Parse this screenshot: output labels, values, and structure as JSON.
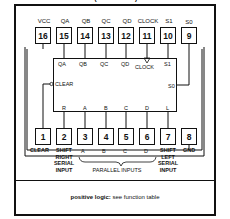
{
  "diagram": {
    "title": "(TOP VIEW)",
    "top_pins": [
      {
        "number": "16",
        "label": "VCC"
      },
      {
        "number": "15",
        "label": "QA"
      },
      {
        "number": "14",
        "label": "QB"
      },
      {
        "number": "13",
        "label": "QC"
      },
      {
        "number": "12",
        "label": "QD"
      },
      {
        "number": "11",
        "label": "CLOCK"
      },
      {
        "number": "10",
        "label": "S1"
      },
      {
        "number": "9",
        "label": "S0"
      }
    ],
    "bottom_pins": [
      {
        "number": "1",
        "label": "CLEAR"
      },
      {
        "number": "2",
        "label": "SHIFT RIGHT SERIAL INPUT"
      },
      {
        "number": "3",
        "label": "A"
      },
      {
        "number": "4",
        "label": "B"
      },
      {
        "number": "5",
        "label": "C"
      },
      {
        "number": "6",
        "label": "D"
      },
      {
        "number": "7",
        "label": "SHIFT LEFT SERIAL INPUT"
      },
      {
        "number": "8",
        "label": "GND"
      }
    ],
    "bottom_labels": {
      "clear": "CLEAR",
      "shift_right": [
        "SHIFT",
        "RIGHT",
        "SERIAL",
        "INPUT"
      ],
      "a": "A",
      "b": "B",
      "c": "C",
      "d": "D",
      "parallel_inputs": "PARALLEL INPUTS",
      "shift_left": [
        "SHIFT",
        "LEFT",
        "SERIAL",
        "INPUT"
      ],
      "gnd": "GND"
    },
    "chip_internal": {
      "top": [
        "QA",
        "QB",
        "QC",
        "QD",
        "CLOCK",
        "S1"
      ],
      "left": "CLEAR",
      "right": "S0",
      "bottom": [
        "R",
        "A",
        "B",
        "C",
        "D",
        "L"
      ]
    },
    "footer": {
      "bold": "positive logic:",
      "text": "see function table"
    }
  }
}
